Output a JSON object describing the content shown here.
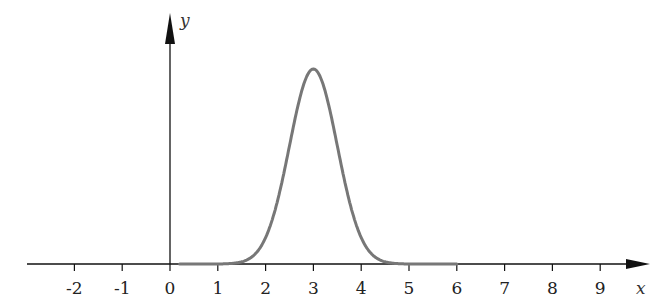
{
  "chart_data": {
    "type": "line",
    "title": "",
    "xlabel": "x",
    "ylabel": "y",
    "xlim": [
      -3,
      10
    ],
    "x_ticks": [
      -2,
      -1,
      0,
      1,
      2,
      3,
      4,
      5,
      6,
      7,
      8,
      9
    ],
    "x_tick_labels": [
      "-2",
      "-1",
      "0",
      "1",
      "2",
      "3",
      "4",
      "5",
      "6",
      "7",
      "8",
      "9"
    ],
    "grid": false,
    "legend": null,
    "series": [
      {
        "name": "gaussian",
        "description": "Bell curve centered at x=3, sigma approx 0.5",
        "mean": 3,
        "sigma": 0.5,
        "color": "#777777",
        "x": [
          1.0,
          1.5,
          2.0,
          2.5,
          3.0,
          3.5,
          4.0,
          4.5,
          5.0
        ],
        "values": [
          0.0,
          0.01,
          0.14,
          0.61,
          1.0,
          0.61,
          0.14,
          0.01,
          0.0
        ]
      }
    ]
  },
  "colors": {
    "axis": "#111111",
    "curve": "#777777"
  }
}
